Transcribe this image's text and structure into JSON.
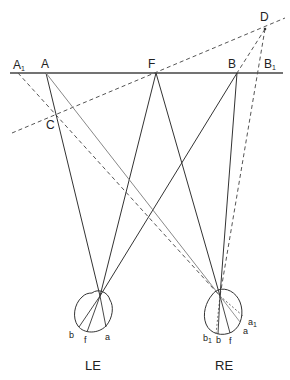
{
  "diagram": {
    "title": "",
    "points": {
      "A": {
        "label": "A",
        "x": 46,
        "y": 73
      },
      "A1": {
        "label": "A",
        "sub": "1",
        "x": 18,
        "y": 73
      },
      "F": {
        "label": "F",
        "x": 156,
        "y": 73
      },
      "B": {
        "label": "B",
        "x": 237,
        "y": 73
      },
      "B1": {
        "label": "B",
        "sub": "1",
        "x": 258,
        "y": 73
      },
      "C": {
        "label": "C",
        "x": 56,
        "y": 118
      },
      "D": {
        "label": "D",
        "x": 265,
        "y": 29
      }
    },
    "left_eye": {
      "name": "LE",
      "retina_labels": {
        "b": "b",
        "f": "f",
        "a": "a"
      }
    },
    "right_eye": {
      "name": "RE",
      "retina_labels": {
        "b1": "b",
        "b1_sub": "1",
        "b": "b",
        "f": "f",
        "a": "a",
        "a1": "a",
        "a1_sub": "1"
      }
    },
    "colors": {
      "solid": "#3a3a3a",
      "light": "#8a8a8a",
      "dashed": "#5a5a5a"
    }
  }
}
